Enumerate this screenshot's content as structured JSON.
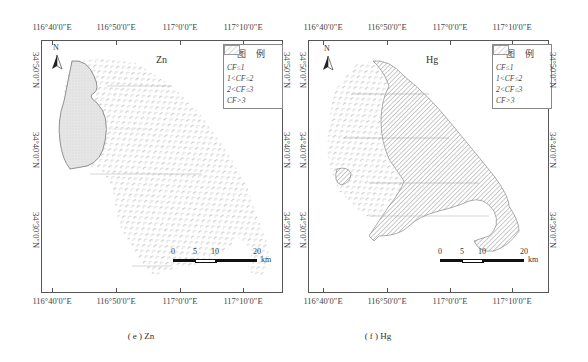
{
  "figure": {
    "panels": [
      {
        "id": "e",
        "element": "Zn",
        "caption": "( e ) Zn",
        "lon_labels": [
          "116°40′0″E",
          "116°50′0″E",
          "117°0′0″E",
          "117°10′0″E"
        ],
        "lat_labels": [
          "34°50′0″N",
          "34°40′0″N",
          "34°30′0″N"
        ],
        "north_label": "N",
        "legend": {
          "title": "图 例",
          "items": [
            {
              "label": "CF≤1",
              "pattern": "stipple"
            },
            {
              "label": "1<CF≤2",
              "pattern": "dash"
            },
            {
              "label": "2<CF≤3",
              "pattern": "dense-hatch"
            },
            {
              "label": "CF>3",
              "pattern": "sparse-hatch"
            }
          ]
        },
        "scale_bar": {
          "ticks": [
            "0",
            "5",
            "10",
            "20"
          ],
          "unit": "km"
        }
      },
      {
        "id": "f",
        "element": "Hg",
        "caption": "( f ) Hg",
        "lon_labels": [
          "116°40′0″E",
          "116°50′0″E",
          "117°0′0″E",
          "117°10′0″E"
        ],
        "lat_labels": [
          "34°50′0″N",
          "34°40′0″N",
          "34°30′0″N"
        ],
        "north_label": "N",
        "legend": {
          "title": "图 例",
          "items": [
            {
              "label": "CF≤1",
              "pattern": "stipple"
            },
            {
              "label": "1<CF≤2",
              "pattern": "dash"
            },
            {
              "label": "2<CF≤3",
              "pattern": "dense-hatch"
            },
            {
              "label": "CF>3",
              "pattern": "sparse-hatch"
            }
          ]
        },
        "scale_bar": {
          "ticks": [
            "0",
            "5",
            "10",
            "20"
          ],
          "unit": "km"
        }
      }
    ]
  },
  "colors": {
    "frame": "#555555",
    "stipple_fill": "#e4e4e4",
    "dash_stroke": "#b5b5b5",
    "hatch_stroke": "#8a8a8a",
    "boundary": "#777777"
  }
}
